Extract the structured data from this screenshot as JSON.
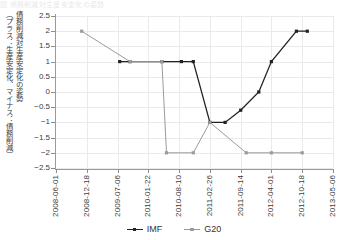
{
  "title_fragment": "図  債務削減対生産安定化の姿勢",
  "axes": {
    "y_label_line1": "債務削減対生産安定化の姿勢",
    "y_label_line2": "（プラス：生産安定化、マイナス：債務削減）",
    "y_ticks": [
      "2.5",
      "2",
      "1.5",
      "1",
      "0.5",
      "0",
      "−0.5",
      "−1",
      "−1.5",
      "−2",
      "−2.5"
    ],
    "x_ticks": [
      "2008-06-01",
      "2008-12-18",
      "2009-07-06",
      "2010-01-22",
      "2010-08-10",
      "2011-02-26",
      "2011-09-14",
      "2012-04-01",
      "2012-10-18",
      "2013-05-06"
    ]
  },
  "legend": {
    "position": "bottom",
    "items": [
      {
        "label": "IMF",
        "color": "#222222"
      },
      {
        "label": "G20",
        "color": "#9b9b9b"
      }
    ]
  },
  "colors": {
    "imf": "#222222",
    "g20": "#9b9b9b",
    "grid": "#e9e9ee",
    "axis": "#9a9a9a"
  },
  "chart_data": {
    "type": "line",
    "title": "債務削減対生産安定化の姿勢",
    "xlabel": "",
    "ylabel": "債務削減対生産安定化の姿勢（プラス：生産安定化、マイナス：債務削減）",
    "ylim": [
      -2.5,
      2.5
    ],
    "xlim": [
      "2008-06-01",
      "2013-05-06"
    ],
    "grid": true,
    "x_tick_labels": [
      "2008-06-01",
      "2008-12-18",
      "2009-07-06",
      "2010-01-22",
      "2010-08-10",
      "2011-02-26",
      "2011-09-14",
      "2012-04-01",
      "2012-10-18",
      "2013-05-06"
    ],
    "y_tick_values": [
      2.5,
      2,
      1.5,
      1,
      0.5,
      0,
      -0.5,
      -1,
      -1.5,
      -2,
      -2.5
    ],
    "series": [
      {
        "name": "IMF",
        "color": "#222222",
        "points": [
          {
            "x": "2009-07-20",
            "y": 1
          },
          {
            "x": "2009-09-25",
            "y": 1
          },
          {
            "x": "2010-04-20",
            "y": 1
          },
          {
            "x": "2010-08-25",
            "y": 1
          },
          {
            "x": "2010-11-10",
            "y": 1
          },
          {
            "x": "2011-02-26",
            "y": -1
          },
          {
            "x": "2011-06-05",
            "y": -1
          },
          {
            "x": "2011-09-14",
            "y": -0.6
          },
          {
            "x": "2012-01-10",
            "y": 0
          },
          {
            "x": "2012-04-01",
            "y": 1
          },
          {
            "x": "2012-09-10",
            "y": 2
          },
          {
            "x": "2012-11-20",
            "y": 2
          }
        ]
      },
      {
        "name": "G20",
        "color": "#9b9b9b",
        "points": [
          {
            "x": "2008-11-15",
            "y": 2
          },
          {
            "x": "2009-09-25",
            "y": 1
          },
          {
            "x": "2010-04-20",
            "y": 1
          },
          {
            "x": "2010-05-20",
            "y": -2
          },
          {
            "x": "2010-11-10",
            "y": -2
          },
          {
            "x": "2011-02-26",
            "y": -1
          },
          {
            "x": "2011-10-20",
            "y": -2
          },
          {
            "x": "2012-04-01",
            "y": -2
          },
          {
            "x": "2012-10-18",
            "y": -2
          }
        ]
      }
    ]
  }
}
